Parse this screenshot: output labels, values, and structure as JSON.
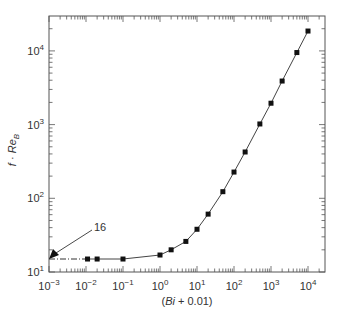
{
  "chart_data": {
    "type": "line",
    "title": "",
    "xlabel": "(Bi + 0.01)",
    "ylabel": "f · Re_B",
    "xscale": "log",
    "yscale": "log",
    "xlim": [
      0.001,
      28000
    ],
    "ylim": [
      10,
      29000
    ],
    "grid": false,
    "legend": null,
    "x_ticks": [
      "10^-3",
      "10^-2",
      "10^-1",
      "10^0",
      "10^1",
      "10^2",
      "10^3",
      "10^4"
    ],
    "y_ticks": [
      "10^1",
      "10^2",
      "10^3",
      "10^4"
    ],
    "series": [
      {
        "name": "f·Re_B vs (Bi+0.01)",
        "marker": "square",
        "x": [
          0.011,
          0.02,
          0.1,
          1,
          2,
          5,
          10,
          20,
          50,
          100,
          200,
          500,
          1000,
          2000,
          5000,
          10000
        ],
        "y": [
          15,
          15,
          15,
          17,
          20,
          26,
          38,
          61,
          123,
          227,
          425,
          1020,
          1950,
          3900,
          9500,
          18600
        ]
      }
    ],
    "annotations": [
      {
        "text": "16",
        "type": "arrow",
        "points_to": [
          0.001,
          16
        ],
        "note": "dash-dot asymptote line at f·Re_B = 16"
      }
    ]
  },
  "labels": {
    "xlabel": "(Bi + 0.01)",
    "ylabel_f": "f · ",
    "ylabel_re": "Re",
    "ylabel_sub": "B",
    "annotation": "16",
    "x_tick_exps": [
      "−3",
      "−2",
      "−1",
      "0",
      "1",
      "2",
      "3",
      "4"
    ],
    "y_tick_exps": [
      "1",
      "2",
      "3",
      "4"
    ],
    "tick_base": "10"
  }
}
